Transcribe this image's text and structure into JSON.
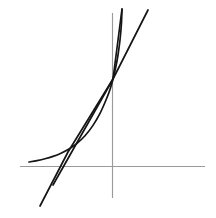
{
  "figure": {
    "background_color": "#ffffff",
    "width": 216,
    "height": 218
  },
  "axes": {
    "color": "#9a9a9a",
    "stroke_width": 1.15,
    "x_axis": {
      "label": "x-axis",
      "x_start": 20,
      "x_end": 205,
      "y": 166.5
    },
    "y_axis": {
      "label": "y-axis",
      "x": 112.5,
      "y_start": 13,
      "y_end": 198
    },
    "origin": {
      "x": 112.5,
      "y": 166.5
    }
  },
  "common_point": {
    "label": "intersection-point",
    "x": 113,
    "y": 79
  },
  "chart_data": {
    "type": "line",
    "xlabel": "",
    "ylabel": "",
    "grid": false,
    "legend": "none",
    "xlim": [
      20,
      205
    ],
    "ylim": [
      198,
      13
    ],
    "annotations": [
      "All three graphs pass through a common point on the y-axis at (113, 79)."
    ],
    "series": [
      {
        "name": "exponential-curve",
        "type": "curve",
        "color": "#151515",
        "points": [
          [
            29,
            162.0
          ],
          [
            37,
            160.6
          ],
          [
            45,
            158.8
          ],
          [
            53,
            156.4
          ],
          [
            61,
            153.2
          ],
          [
            69,
            149.0
          ],
          [
            77,
            143.4
          ],
          [
            85,
            135.8
          ],
          [
            93,
            125.4
          ],
          [
            100,
            113.4
          ],
          [
            106,
            100.0
          ],
          [
            110,
            89.4
          ],
          [
            113,
            79.0
          ],
          [
            116,
            66.0
          ],
          [
            118,
            55.0
          ],
          [
            120,
            40.0
          ],
          [
            121.4,
            24.0
          ],
          [
            122,
            9.0
          ]
        ]
      },
      {
        "name": "steep-line",
        "type": "straight",
        "color": "#151515",
        "points": [
          [
            40,
            206.0
          ],
          [
            68,
            152.0
          ],
          [
            113,
            79.0
          ],
          [
            122,
            9.0
          ]
        ]
      },
      {
        "name": "tangent-line",
        "type": "straight",
        "color": "#151515",
        "points": [
          [
            53,
            185.0
          ],
          [
            113,
            79.0
          ],
          [
            148,
            10.0
          ]
        ]
      }
    ]
  }
}
